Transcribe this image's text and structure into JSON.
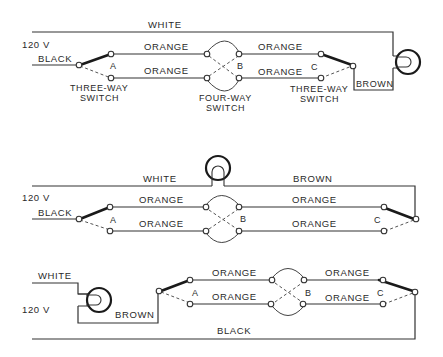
{
  "diagram": {
    "colors": {
      "wire": "#333333",
      "background": "#ffffff"
    },
    "top": {
      "white": "WHITE",
      "voltage": "120 V",
      "black": "BLACK",
      "orange_1": "ORANGE",
      "orange_2": "ORANGE",
      "orange_3": "ORANGE",
      "orange_4": "ORANGE",
      "switch_a": "A",
      "switch_b": "B",
      "switch_c": "C",
      "brown": "BROWN",
      "three_way_left_1": "THREE-WAY",
      "three_way_left_2": "SWITCH",
      "four_way_1": "FOUR-WAY",
      "four_way_2": "SWITCH",
      "three_way_right_1": "THREE-WAY",
      "three_way_right_2": "SWITCH"
    },
    "middle": {
      "white": "WHITE",
      "brown": "BROWN",
      "voltage": "120 V",
      "black": "BLACK",
      "orange_1": "ORANGE",
      "orange_2": "ORANGE",
      "orange_3": "ORANGE",
      "orange_4": "ORANGE",
      "switch_a": "A",
      "switch_b": "B",
      "switch_c": "C"
    },
    "bottom": {
      "white": "WHITE",
      "voltage": "120 V",
      "brown": "BROWN",
      "black": "BLACK",
      "orange_1": "ORANGE",
      "orange_2": "ORANGE",
      "orange_3": "ORANGE",
      "orange_4": "ORANGE",
      "switch_a": "A",
      "switch_b": "B",
      "switch_c": "C"
    }
  }
}
